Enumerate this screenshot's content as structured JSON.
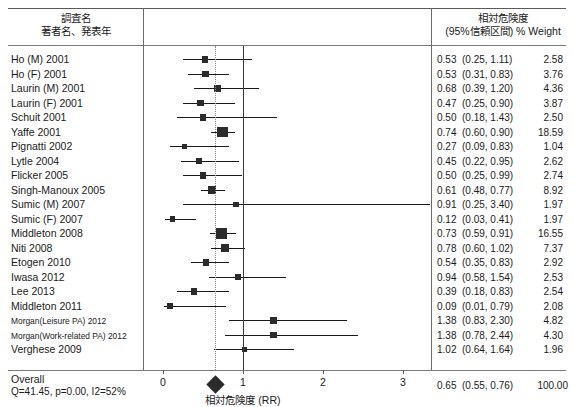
{
  "header": {
    "left_line1": "調査名",
    "left_line2": "著者名、発表年",
    "right_line1": "相対危険度",
    "right_line2": "(95%信頼区間)  % Weight"
  },
  "axis": {
    "title": "相対危険度 (RR)",
    "ticks": [
      "0",
      "1",
      "2",
      "3"
    ],
    "tick_values": [
      0,
      1,
      2,
      3
    ],
    "xmin": 0,
    "xmax": 3.35,
    "null_value": 1,
    "pooled_ref": 0.65
  },
  "overall": {
    "label": "Overall",
    "hetero": "Q=41.45, p=0.00, I2=52%",
    "rr": "0.65",
    "ci": "(0.55, 0.76)",
    "weight": "100.00"
  },
  "chart_data": {
    "type": "forest",
    "title": "",
    "xlabel": "相対危険度 (RR)",
    "ylabel": "",
    "xlim": [
      0,
      3.35
    ],
    "ticks": [
      0,
      1,
      2,
      3
    ],
    "null_line": 1,
    "pooled_line": 0.65,
    "columns": [
      "調査名 著者名、発表年",
      "相対危険度 (95%信頼区間)",
      "% Weight"
    ],
    "studies": [
      {
        "label": "Ho (M) 2001",
        "rr": 0.53,
        "lo": 0.25,
        "hi": 1.11,
        "weight": 2.58,
        "rr_text": "0.53",
        "ci_text": "(0.25, 1.11)",
        "weight_text": "2.58"
      },
      {
        "label": "Ho (F) 2001",
        "rr": 0.53,
        "lo": 0.31,
        "hi": 0.83,
        "weight": 3.76,
        "rr_text": "0.53",
        "ci_text": "(0.31, 0.83)",
        "weight_text": "3.76"
      },
      {
        "label": "Laurin (M) 2001",
        "rr": 0.68,
        "lo": 0.39,
        "hi": 1.2,
        "weight": 4.36,
        "rr_text": "0.68",
        "ci_text": "(0.39, 1.20)",
        "weight_text": "4.36"
      },
      {
        "label": "Laurin (F) 2001",
        "rr": 0.47,
        "lo": 0.25,
        "hi": 0.9,
        "weight": 3.87,
        "rr_text": "0.47",
        "ci_text": "(0.25, 0.90)",
        "weight_text": "3.87"
      },
      {
        "label": "Schuit 2001",
        "rr": 0.5,
        "lo": 0.18,
        "hi": 1.43,
        "weight": 2.5,
        "rr_text": "0.50",
        "ci_text": "(0.18, 1.43)",
        "weight_text": "2.50"
      },
      {
        "label": "Yaffe 2001",
        "rr": 0.74,
        "lo": 0.6,
        "hi": 0.9,
        "weight": 18.59,
        "rr_text": "0.74",
        "ci_text": "(0.60, 0.90)",
        "weight_text": "18.59"
      },
      {
        "label": "Pignatti 2002",
        "rr": 0.27,
        "lo": 0.09,
        "hi": 0.83,
        "weight": 1.04,
        "rr_text": "0.27",
        "ci_text": "(0.09, 0.83)",
        "weight_text": "1.04"
      },
      {
        "label": "Lytle 2004",
        "rr": 0.45,
        "lo": 0.22,
        "hi": 0.95,
        "weight": 2.62,
        "rr_text": "0.45",
        "ci_text": "(0.22, 0.95)",
        "weight_text": "2.62"
      },
      {
        "label": "Flicker 2005",
        "rr": 0.5,
        "lo": 0.25,
        "hi": 0.99,
        "weight": 2.74,
        "rr_text": "0.50",
        "ci_text": "(0.25, 0.99)",
        "weight_text": "2.74"
      },
      {
        "label": "Singh-Manoux 2005",
        "rr": 0.61,
        "lo": 0.48,
        "hi": 0.77,
        "weight": 8.92,
        "rr_text": "0.61",
        "ci_text": "(0.48, 0.77)",
        "weight_text": "8.92"
      },
      {
        "label": "Sumic (M) 2007",
        "rr": 0.91,
        "lo": 0.25,
        "hi": 3.4,
        "weight": 1.97,
        "rr_text": "0.91",
        "ci_text": "(0.25, 3.40)",
        "weight_text": "1.97"
      },
      {
        "label": "Sumic (F) 2007",
        "rr": 0.12,
        "lo": 0.03,
        "hi": 0.41,
        "weight": 1.97,
        "rr_text": "0.12",
        "ci_text": "(0.03, 0.41)",
        "weight_text": "1.97"
      },
      {
        "label": "Middleton 2008",
        "rr": 0.73,
        "lo": 0.59,
        "hi": 0.91,
        "weight": 16.55,
        "rr_text": "0.73",
        "ci_text": "(0.59, 0.91)",
        "weight_text": "16.55"
      },
      {
        "label": "Niti 2008",
        "rr": 0.78,
        "lo": 0.6,
        "hi": 1.02,
        "weight": 7.37,
        "rr_text": "0.78",
        "ci_text": "(0.60, 1.02)",
        "weight_text": "7.37"
      },
      {
        "label": "Etogen 2010",
        "rr": 0.54,
        "lo": 0.35,
        "hi": 0.83,
        "weight": 2.92,
        "rr_text": "0.54",
        "ci_text": "(0.35, 0.83)",
        "weight_text": "2.92"
      },
      {
        "label": "Iwasa 2012",
        "rr": 0.94,
        "lo": 0.58,
        "hi": 1.54,
        "weight": 2.53,
        "rr_text": "0.94",
        "ci_text": "(0.58, 1.54)",
        "weight_text": "2.53"
      },
      {
        "label": "Lee 2013",
        "rr": 0.39,
        "lo": 0.18,
        "hi": 0.83,
        "weight": 2.54,
        "rr_text": "0.39",
        "ci_text": "(0.18, 0.83)",
        "weight_text": "2.54"
      },
      {
        "label": "Middleton 2011",
        "rr": 0.09,
        "lo": 0.01,
        "hi": 0.79,
        "weight": 2.08,
        "rr_text": "0.09",
        "ci_text": "(0.01, 0.79)",
        "weight_text": "2.08"
      },
      {
        "label": "Morgan(Leisure PA) 2012",
        "rr": 1.38,
        "lo": 0.83,
        "hi": 2.3,
        "weight": 4.82,
        "rr_text": "1.38",
        "ci_text": "(0.83, 2.30)",
        "weight_text": "4.82",
        "small": true
      },
      {
        "label": "Morgan(Work-related PA) 2012",
        "rr": 1.38,
        "lo": 0.78,
        "hi": 2.44,
        "weight": 4.3,
        "rr_text": "1.38",
        "ci_text": "(0.78, 2.44)",
        "weight_text": "4.30",
        "small": true
      },
      {
        "label": "Verghese 2009",
        "rr": 1.02,
        "lo": 0.64,
        "hi": 1.64,
        "weight": 1.96,
        "rr_text": "1.02",
        "ci_text": "(0.64, 1.64)",
        "weight_text": "1.96"
      }
    ],
    "summary": {
      "label": "Overall",
      "rr": 0.65,
      "lo": 0.55,
      "hi": 0.76,
      "weight": 100.0,
      "hetero": "Q=41.45, p=0.00, I2=52%",
      "rr_text": "0.65",
      "ci_text": "(0.55, 0.76)",
      "weight_text": "100.00"
    }
  }
}
